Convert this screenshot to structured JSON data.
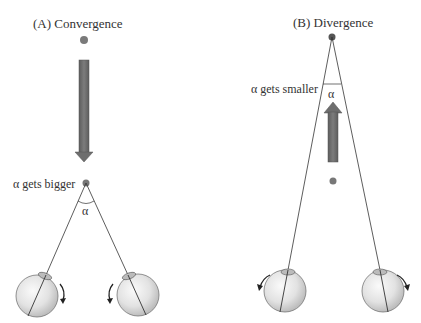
{
  "panels": {
    "a": {
      "title": "(A)  Convergence",
      "angle_label": "α gets bigger",
      "angle_symbol": "α",
      "arrow_direction": "down",
      "eye_rotation": "inward"
    },
    "b": {
      "title": "(B)  Divergence",
      "angle_label": "α gets smaller",
      "angle_symbol": "α",
      "arrow_direction": "up",
      "eye_rotation": "outward"
    }
  },
  "colors": {
    "dot": "#7a7a7a",
    "arrow": "#6e6e6e",
    "line": "#333333",
    "eye": "#e6e6e6"
  }
}
